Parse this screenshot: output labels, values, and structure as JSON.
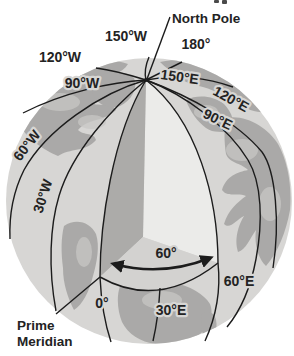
{
  "figure": {
    "background": "#ffffff",
    "colors": {
      "ocean": "#d7d6d4",
      "land": "#a6a5a3",
      "land_light": "#c7c6c4",
      "land_dark": "#8f8e8c",
      "wedge_left_face": "#acaba9",
      "wedge_right_face": "#ebebe9",
      "wedge_bottom_face": "#d3d2d0",
      "line": "#1c1c1c",
      "text": "#232323"
    },
    "labels": {
      "north_pole": "North Pole",
      "prime_l1": "Prime",
      "prime_l2": "Meridian",
      "angle60": "60°",
      "deg150w": "150°W",
      "deg180": "180°",
      "deg120w": "120°W",
      "deg90w": "90°W",
      "deg150e": "150°E",
      "deg120e": "120°E",
      "deg90e": "90°E",
      "deg60w": "60°W",
      "deg30w": "30°W",
      "deg0": "0°",
      "deg30e": "30°E",
      "deg60e": "60°E"
    }
  }
}
